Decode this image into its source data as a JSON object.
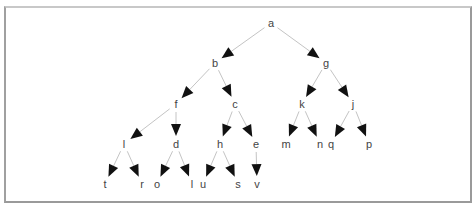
{
  "diagram": {
    "type": "tree",
    "root": "a",
    "colors": {
      "edge": "#c4c4c4",
      "arrowhead": "#111111",
      "label": "#444444",
      "border": "#9a9a9a",
      "background": "#ffffff"
    },
    "nodes": [
      {
        "id": "a",
        "label": "a",
        "x": 271,
        "y": 23
      },
      {
        "id": "b",
        "label": "b",
        "x": 215,
        "y": 63
      },
      {
        "id": "g",
        "label": "g",
        "x": 326,
        "y": 63
      },
      {
        "id": "f",
        "label": "f",
        "x": 176,
        "y": 104
      },
      {
        "id": "c",
        "label": "c",
        "x": 235,
        "y": 104
      },
      {
        "id": "k",
        "label": "k",
        "x": 302,
        "y": 104
      },
      {
        "id": "j",
        "label": "j",
        "x": 353,
        "y": 104
      },
      {
        "id": "l",
        "label": "l",
        "x": 124,
        "y": 144
      },
      {
        "id": "d",
        "label": "d",
        "x": 176,
        "y": 144
      },
      {
        "id": "h",
        "label": "h",
        "x": 220,
        "y": 144
      },
      {
        "id": "e",
        "label": "e",
        "x": 256,
        "y": 144
      },
      {
        "id": "m",
        "label": "m",
        "x": 286,
        "y": 144
      },
      {
        "id": "n",
        "label": "n",
        "x": 320,
        "y": 144
      },
      {
        "id": "q",
        "label": "q",
        "x": 331,
        "y": 144
      },
      {
        "id": "p",
        "label": "p",
        "x": 369,
        "y": 144
      },
      {
        "id": "t",
        "label": "t",
        "x": 105,
        "y": 184
      },
      {
        "id": "r",
        "label": "r",
        "x": 142,
        "y": 184
      },
      {
        "id": "o",
        "label": "o",
        "x": 157,
        "y": 184
      },
      {
        "id": "I",
        "label": "l",
        "x": 192,
        "y": 184
      },
      {
        "id": "u",
        "label": "u",
        "x": 203,
        "y": 184
      },
      {
        "id": "s",
        "label": "s",
        "x": 238,
        "y": 184
      },
      {
        "id": "v",
        "label": "v",
        "x": 257,
        "y": 184
      }
    ],
    "edges": [
      {
        "from": "a",
        "to": "b"
      },
      {
        "from": "a",
        "to": "g"
      },
      {
        "from": "b",
        "to": "f"
      },
      {
        "from": "b",
        "to": "c"
      },
      {
        "from": "g",
        "to": "k"
      },
      {
        "from": "g",
        "to": "j"
      },
      {
        "from": "f",
        "to": "l"
      },
      {
        "from": "f",
        "to": "d"
      },
      {
        "from": "c",
        "to": "h"
      },
      {
        "from": "c",
        "to": "e"
      },
      {
        "from": "k",
        "to": "m"
      },
      {
        "from": "k",
        "to": "n"
      },
      {
        "from": "j",
        "to": "q"
      },
      {
        "from": "j",
        "to": "p"
      },
      {
        "from": "l",
        "to": "t"
      },
      {
        "from": "l",
        "to": "r"
      },
      {
        "from": "d",
        "to": "o"
      },
      {
        "from": "d",
        "to": "I"
      },
      {
        "from": "h",
        "to": "u"
      },
      {
        "from": "h",
        "to": "s"
      },
      {
        "from": "e",
        "to": "v"
      }
    ]
  }
}
